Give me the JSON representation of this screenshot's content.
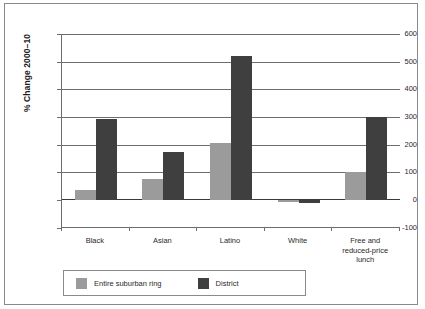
{
  "chart_data": {
    "type": "bar",
    "title": "",
    "xlabel": "",
    "ylabel": "% Change 2000–10",
    "ylim": [
      -100,
      600
    ],
    "yticks": [
      -100,
      0,
      100,
      200,
      300,
      400,
      500,
      600
    ],
    "ytick_labels": [
      "-100",
      "0",
      "100",
      "200",
      "300",
      "400",
      "500",
      "600"
    ],
    "grid": true,
    "legend_position": "bottom",
    "categories": [
      "Black",
      "Asian",
      "Latino",
      "White",
      "Free and reduced-price lunch"
    ],
    "series": [
      {
        "name": "Entire suburban ring",
        "color": "#9b9b9b",
        "values": [
          36,
          75,
          205,
          -6,
          100
        ]
      },
      {
        "name": "District",
        "color": "#3f3f3f",
        "values": [
          293,
          175,
          520,
          -10,
          300
        ]
      }
    ]
  },
  "axis": {
    "y_label": "% Change 2000–10"
  },
  "categories_display": [
    [
      "Black"
    ],
    [
      "Asian"
    ],
    [
      "Latino"
    ],
    [
      "White"
    ],
    [
      "Free and",
      "reduced-price",
      "lunch"
    ]
  ],
  "legend": {
    "items": [
      {
        "label": "Entire suburban ring",
        "color": "#9b9b9b"
      },
      {
        "label": "District",
        "color": "#3f3f3f"
      }
    ]
  },
  "colors": {
    "suburban_ring": "#9b9b9b",
    "district": "#3f3f3f",
    "axis": "#6d6d6d",
    "frame": "#8a8a8a",
    "background": "#ffffff"
  }
}
